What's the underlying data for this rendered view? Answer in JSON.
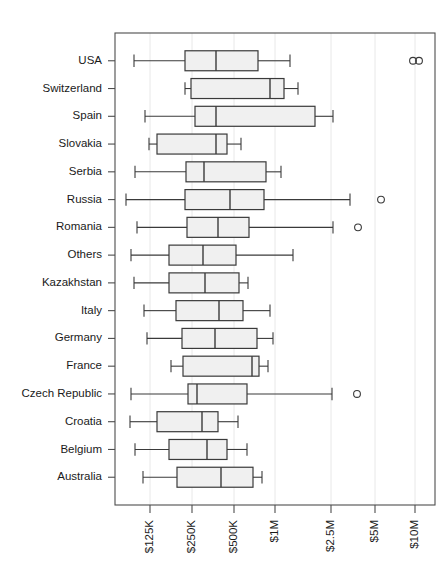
{
  "chart_data": {
    "type": "box",
    "title": "",
    "xlabel": "",
    "ylabel": "",
    "orientation": "horizontal",
    "xscale": "log",
    "grid": true,
    "legend": null,
    "xtick_labels": [
      "$125K",
      "$250K",
      "$500K",
      "$1M",
      "$2.5M",
      "$5M",
      "$10M"
    ],
    "xtick_values": [
      125000,
      250000,
      500000,
      1000000,
      2500000,
      5000000,
      10000000
    ],
    "xtick_pixels": [
      150,
      192,
      234,
      275,
      331,
      375,
      415
    ],
    "categories": [
      "USA",
      "Switzerland",
      "Spain",
      "Slovakia",
      "Serbia",
      "Russia",
      "Romania",
      "Others",
      "Kazakhstan",
      "Italy",
      "Germany",
      "France",
      "Czech Republic",
      "Croatia",
      "Belgium",
      "Australia"
    ],
    "boxes": [
      {
        "label": "USA",
        "whisker_low": 134,
        "q1": 185,
        "median": 216,
        "q3": 258,
        "whisker_high": 290,
        "outliers": [
          413,
          419
        ]
      },
      {
        "label": "Switzerland",
        "whisker_low": 185,
        "q1": 191,
        "median": 270,
        "q3": 284,
        "whisker_high": 298,
        "outliers": []
      },
      {
        "label": "Spain",
        "whisker_low": 145,
        "q1": 195,
        "median": 216,
        "q3": 315,
        "whisker_high": 333,
        "outliers": []
      },
      {
        "label": "Slovakia",
        "whisker_low": 149,
        "q1": 157,
        "median": 216,
        "q3": 227,
        "whisker_high": 241,
        "outliers": []
      },
      {
        "label": "Serbia",
        "whisker_low": 135,
        "q1": 186,
        "median": 204,
        "q3": 266,
        "whisker_high": 281,
        "outliers": []
      },
      {
        "label": "Russia",
        "whisker_low": 126,
        "q1": 185,
        "median": 230,
        "q3": 264,
        "whisker_high": 350,
        "outliers": [
          381
        ]
      },
      {
        "label": "Romania",
        "whisker_low": 137,
        "q1": 187,
        "median": 218,
        "q3": 249,
        "whisker_high": 333,
        "outliers": [
          358
        ]
      },
      {
        "label": "Others",
        "whisker_low": 131,
        "q1": 169,
        "median": 203,
        "q3": 236,
        "whisker_high": 293,
        "outliers": []
      },
      {
        "label": "Kazakhstan",
        "whisker_low": 134,
        "q1": 169,
        "median": 205,
        "q3": 239,
        "whisker_high": 248,
        "outliers": []
      },
      {
        "label": "Italy",
        "whisker_low": 144,
        "q1": 176,
        "median": 219,
        "q3": 243,
        "whisker_high": 270,
        "outliers": []
      },
      {
        "label": "Germany",
        "whisker_low": 147,
        "q1": 182,
        "median": 215,
        "q3": 257,
        "whisker_high": 273,
        "outliers": []
      },
      {
        "label": "France",
        "whisker_low": 171,
        "q1": 183,
        "median": 252,
        "q3": 259,
        "whisker_high": 268,
        "outliers": []
      },
      {
        "label": "Czech Republic",
        "whisker_low": 131,
        "q1": 188,
        "median": 197,
        "q3": 247,
        "whisker_high": 332,
        "outliers": [
          357
        ]
      },
      {
        "label": "Croatia",
        "whisker_low": 130,
        "q1": 157,
        "median": 202,
        "q3": 218,
        "whisker_high": 238,
        "outliers": []
      },
      {
        "label": "Belgium",
        "whisker_low": 135,
        "q1": 169,
        "median": 207,
        "q3": 227,
        "whisker_high": 247,
        "outliers": []
      },
      {
        "label": "Australia",
        "whisker_low": 143,
        "q1": 177,
        "median": 221,
        "q3": 253,
        "whisker_high": 262,
        "outliers": []
      }
    ],
    "plot_area": {
      "left": 115,
      "right": 435,
      "top": 33,
      "bottom": 505
    },
    "colors": {
      "box_fill": "#f0f0f0",
      "box_stroke": "#3a3a3a",
      "grid": "#e8e8e8",
      "frame": "#4d4d4d",
      "text": "#1a1a1a",
      "background": "#ffffff"
    }
  }
}
